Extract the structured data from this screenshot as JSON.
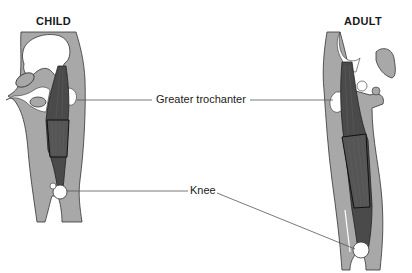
{
  "titles": {
    "child": "CHILD",
    "adult": "ADULT"
  },
  "labels": {
    "greater_trochanter": "Greater trochanter",
    "knee": "Knee"
  },
  "colors": {
    "soft_tissue": "#a8a8a8",
    "muscle": "#4a4a4a",
    "bone": "#ffffff",
    "outline": "#333333",
    "leader_line": "#555555"
  }
}
